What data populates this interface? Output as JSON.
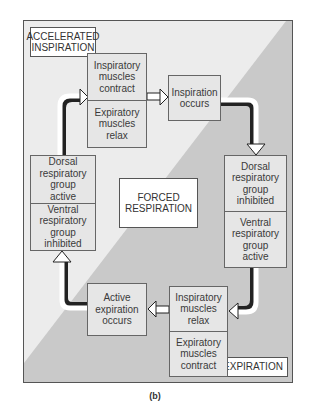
{
  "figure": {
    "caption": "(b)",
    "colors": {
      "inspiration_region": "#ececec",
      "expiration_region": "#c8c8c8",
      "box_fill": "#e6e6e6",
      "label_fill": "#ffffff",
      "border": "#555555"
    }
  },
  "regions": {
    "inspiration": {
      "label": "ACCELERATED\nINSPIRATION"
    },
    "expiration": {
      "label": "EXPIRATION"
    },
    "center": {
      "label": "FORCED\nRESPIRATION"
    }
  },
  "nodes": {
    "top": {
      "upper": "Inspiratory\nmuscles\ncontract",
      "lower": "Expiratory\nmuscles\nrelax"
    },
    "inspiration_occurs": {
      "text": "Inspiration\noccurs"
    },
    "right": {
      "upper": "Dorsal\nrespiratory\ngroup\ninhibited",
      "lower": "Ventral\nrespiratory\ngroup\nactive"
    },
    "bottom": {
      "upper": "Inspiratory\nmuscles\nrelax",
      "lower": "Expiratory\nmuscles\ncontract"
    },
    "active_expiration": {
      "text": "Active\nexpiration\noccurs"
    },
    "left": {
      "upper": "Dorsal\nrespiratory\ngroup\nactive",
      "lower": "Ventral\nrespiratory\ngroup\ninhibited"
    }
  },
  "flow": [
    "Inspiratory muscles contract / Expiratory muscles relax",
    "Inspiration occurs",
    "Dorsal respiratory group inhibited / Ventral respiratory group active",
    "Inspiratory muscles relax / Expiratory muscles contract",
    "Active expiration occurs",
    "Dorsal respiratory group active / Ventral respiratory group inhibited"
  ]
}
